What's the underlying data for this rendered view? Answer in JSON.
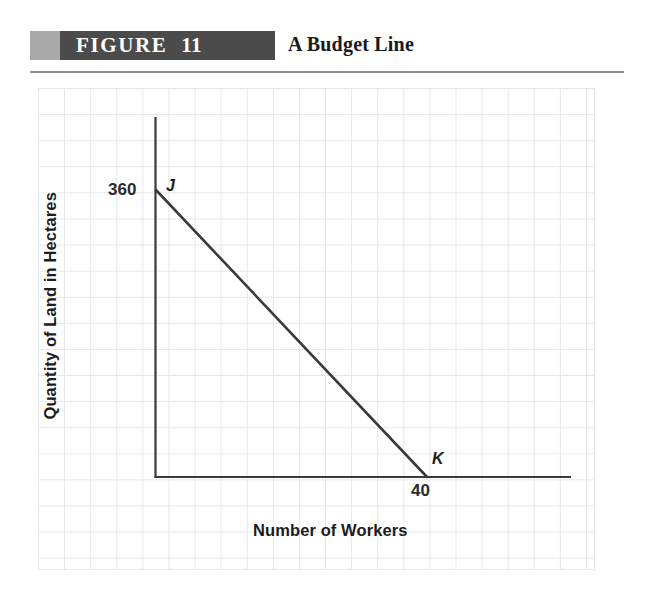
{
  "header": {
    "figure_word": "FIGURE",
    "figure_number": "11",
    "title": "A Budget Line"
  },
  "chart_data": {
    "type": "line",
    "title": "A Budget Line",
    "xlabel": "Number of Workers",
    "ylabel": "Quantity of Land in Hectares",
    "xlim": [
      0,
      61
    ],
    "ylim": [
      0,
      540
    ],
    "grid": true,
    "legend_position": "none",
    "series": [
      {
        "name": "Budget Line",
        "x": [
          0,
          40
        ],
        "y": [
          360,
          0
        ],
        "color": "#3a3a3a"
      }
    ],
    "annotations": [
      {
        "label": "J",
        "x": 0,
        "y": 360,
        "style": "italic-bold"
      },
      {
        "label": "K",
        "x": 40,
        "y": 0,
        "style": "italic-bold"
      }
    ],
    "xticks": [
      "40"
    ],
    "yticks": [
      "360"
    ],
    "axis_color": "#3a3a3a",
    "grid_color": "#e3e8ed"
  },
  "axes": {
    "y_tick_360": "360",
    "x_tick_40": "40",
    "y_axis_title": "Quantity of Land in Hectares",
    "x_axis_title": "Number of Workers"
  },
  "points": {
    "j": "J",
    "k": "K"
  }
}
